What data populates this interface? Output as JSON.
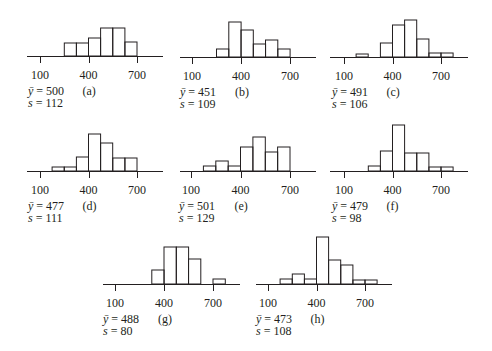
{
  "chart_data": {
    "type": "bar",
    "title": "",
    "xlabel": "",
    "ylabel": "",
    "xlim": [
      -25,
      850
    ],
    "x_ticks": [
      100,
      400,
      700
    ],
    "bin_width": 75,
    "grid": false,
    "panels": [
      {
        "id": "a",
        "label": "(a)",
        "mean": 500,
        "sd": 112,
        "bins": [
          250,
          325,
          400,
          475,
          550,
          625
        ],
        "heights": [
          13,
          13,
          18,
          28,
          28,
          14
        ]
      },
      {
        "id": "b",
        "label": "(b)",
        "mean": 451,
        "sd": 109,
        "bins": [
          250,
          325,
          400,
          475,
          550,
          625
        ],
        "heights": [
          8,
          35,
          27,
          13,
          17,
          8
        ]
      },
      {
        "id": "c",
        "label": "(c)",
        "mean": 491,
        "sd": 106,
        "bins": [
          175,
          325,
          400,
          475,
          550,
          625,
          700
        ],
        "heights": [
          3,
          14,
          32,
          37,
          18,
          4,
          4
        ]
      },
      {
        "id": "d",
        "label": "(d)",
        "mean": 477,
        "sd": 111,
        "bins": [
          175,
          250,
          325,
          400,
          475,
          550,
          625
        ],
        "heights": [
          4,
          4,
          14,
          37,
          28,
          13,
          13
        ]
      },
      {
        "id": "e",
        "label": "(e)",
        "mean": 501,
        "sd": 129,
        "bins": [
          175,
          250,
          325,
          400,
          475,
          550,
          625
        ],
        "heights": [
          5,
          10,
          5,
          24,
          34,
          19,
          24
        ]
      },
      {
        "id": "f",
        "label": "(f)",
        "mean": 479,
        "sd": 98,
        "bins": [
          250,
          325,
          400,
          475,
          550,
          625,
          700
        ],
        "heights": [
          5,
          20,
          46,
          18,
          18,
          4,
          4
        ]
      },
      {
        "id": "g",
        "label": "(g)",
        "mean": 488,
        "sd": 80,
        "bins": [
          325,
          400,
          475,
          550,
          700
        ],
        "heights": [
          14,
          37,
          37,
          25,
          5
        ]
      },
      {
        "id": "h",
        "label": "(h)",
        "mean": 473,
        "sd": 108,
        "bins": [
          175,
          250,
          325,
          400,
          475,
          550,
          625,
          700
        ],
        "heights": [
          5,
          10,
          5,
          47,
          24,
          19,
          4,
          4
        ]
      }
    ]
  },
  "panels": [
    {
      "letter": "(a)",
      "mean_label": "ȳ = 500",
      "sd_label": "s = 112"
    },
    {
      "letter": "(b)",
      "mean_label": "ȳ = 451",
      "sd_label": "s = 109"
    },
    {
      "letter": "(c)",
      "mean_label": "ȳ = 491",
      "sd_label": "s = 106"
    },
    {
      "letter": "(d)",
      "mean_label": "ȳ = 477",
      "sd_label": "s = 111"
    },
    {
      "letter": "(e)",
      "mean_label": "ȳ = 501",
      "sd_label": "s = 129"
    },
    {
      "letter": "(f)",
      "mean_label": "ȳ = 479",
      "sd_label": "s = 98"
    },
    {
      "letter": "(g)",
      "mean_label": "ȳ = 488",
      "sd_label": "s = 80"
    },
    {
      "letter": "(h)",
      "mean_label": "ȳ = 473",
      "sd_label": "s = 108"
    }
  ],
  "tick_labels": [
    "100",
    "400",
    "700"
  ],
  "colors": {
    "ink": "#231f20",
    "background": "#ffffff"
  }
}
